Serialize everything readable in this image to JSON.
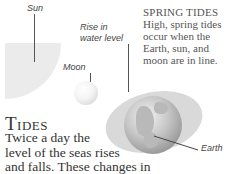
{
  "diagram": {
    "labels": {
      "sun": "Sun",
      "rise": [
        "Rise in",
        "water level"
      ],
      "moon": "Moon",
      "earth": "Earth"
    },
    "caption": {
      "heading": "SPRING TIDES",
      "lines": [
        "High, spring tides",
        "occur when the",
        "Earth, sun, and",
        "moon are in line."
      ]
    },
    "colors": {
      "sun": "#ebebeb",
      "water": "#d9d9d9",
      "earth": "#9a9a9a"
    }
  },
  "article": {
    "title": "Tides",
    "lines": [
      "Twice a day the",
      "level of the seas rises",
      "and falls. These changes in"
    ]
  }
}
